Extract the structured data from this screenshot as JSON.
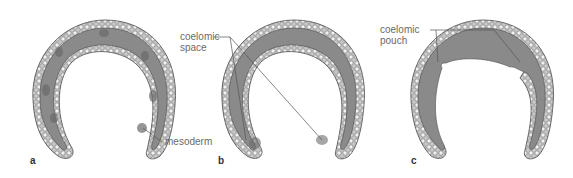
{
  "figure": {
    "panels": [
      {
        "letter": "a",
        "labels": [
          {
            "text": "mesoderm"
          }
        ]
      },
      {
        "letter": "b",
        "labels": [
          {
            "text": "coelomic\nspace"
          }
        ]
      },
      {
        "letter": "c",
        "labels": [
          {
            "text": "coelomic\npouch"
          }
        ]
      }
    ]
  },
  "colors": {
    "mesoderm_fill": "#8a8a8a",
    "cell_layer": "#c9c9c9",
    "outline": "#4a4a4a",
    "label_text": "#6a6a6a"
  }
}
